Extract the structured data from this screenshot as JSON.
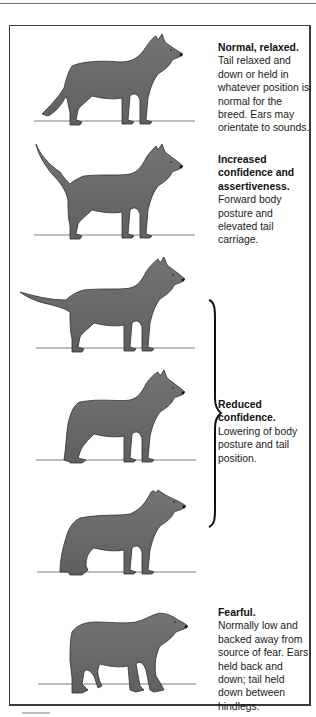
{
  "figure": {
    "colors": {
      "dog_fill": "#6f6f6f",
      "dog_shadow": "#4f4f4f",
      "outline": "#2e2e2e",
      "ground_line": "#7d7d7d",
      "frame_border": "#3a3a3a",
      "text": "#1a1a1a"
    },
    "postures": [
      {
        "id": "normal",
        "title": "Normal, relaxed.",
        "description": "Tail relaxed and down or held in whatever position is normal for the breed. Ears may orientate to sounds."
      },
      {
        "id": "increased-confidence",
        "title": "Increased confidence and assertiveness.",
        "description": "Forward body posture and elevated tail carriage."
      },
      {
        "id": "reduced-confidence-1",
        "title": "",
        "description": ""
      },
      {
        "id": "reduced-confidence-2",
        "title": "Reduced confidence.",
        "description": "Lowering of body posture and tail position."
      },
      {
        "id": "reduced-confidence-3",
        "title": "",
        "description": ""
      },
      {
        "id": "fearful",
        "title": "Fearful.",
        "description": "Normally low and backed away from source of fear. Ears held back and down; tail held down between hindlegs."
      }
    ],
    "brace_group": {
      "label_ref": "Reduced confidence.",
      "spans_postures": [
        "reduced-confidence-1",
        "reduced-confidence-2",
        "reduced-confidence-3"
      ]
    }
  }
}
